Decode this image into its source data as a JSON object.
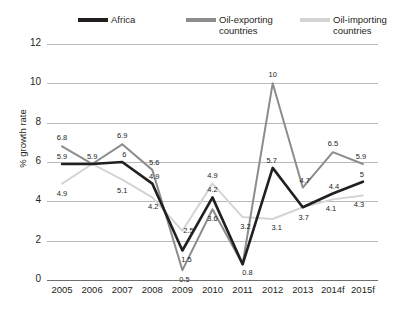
{
  "top_partial_text": "",
  "legend": {
    "entries": [
      {
        "label": "Africa",
        "color": "#231f20"
      },
      {
        "label": "Oil-exporting\ncountries",
        "color": "#8c8c8c"
      },
      {
        "label": "Oil-importing\ncountries",
        "color": "#d4d4d4"
      }
    ]
  },
  "axis": {
    "ylabel": "% growth rate",
    "yticks": [
      "0",
      "2",
      "4",
      "6",
      "8",
      "10",
      "12"
    ],
    "xticks": [
      "2005",
      "2006",
      "2007",
      "2008",
      "2009",
      "2010",
      "2011",
      "2012",
      "2013",
      "2014f",
      "2015f"
    ]
  },
  "chart_data": {
    "type": "line",
    "title": "",
    "xlabel": "",
    "ylabel": "% growth rate",
    "ylim": [
      0,
      12
    ],
    "grid": true,
    "legend_position": "top",
    "categories": [
      "2005",
      "2006",
      "2007",
      "2008",
      "2009",
      "2010",
      "2011",
      "2012",
      "2013",
      "2014f",
      "2015f"
    ],
    "series": [
      {
        "name": "Africa",
        "color": "#231f20",
        "values": [
          5.9,
          5.9,
          6.0,
          4.9,
          1.5,
          4.2,
          0.8,
          5.7,
          3.7,
          4.4,
          5.0
        ],
        "labels": [
          "5.9",
          "5.9",
          "6",
          "4.9",
          "1.5",
          "4.2",
          "0.8",
          "5.7",
          "3.7",
          "4.4",
          "5"
        ]
      },
      {
        "name": "Oil-exporting countries",
        "color": "#8c8c8c",
        "values": [
          6.8,
          5.9,
          6.9,
          5.6,
          0.5,
          3.6,
          0.8,
          10.0,
          4.7,
          6.5,
          5.9
        ],
        "labels": [
          "6.8",
          "5.9",
          "6.9",
          "5.6",
          "0.5",
          "3.6",
          "0.8",
          "10",
          "4.7",
          "6.5",
          "5.9"
        ]
      },
      {
        "name": "Oil-importing countries",
        "color": "#d4d4d4",
        "values": [
          4.9,
          5.9,
          5.1,
          4.2,
          2.5,
          4.9,
          3.2,
          3.1,
          3.7,
          4.1,
          4.3
        ],
        "labels": [
          "4.9",
          "5.9",
          "5.1",
          "4.2",
          "2.5",
          "4.9",
          "3.2",
          "3.1",
          "3.7",
          "4.1",
          "4.3"
        ]
      }
    ],
    "point_labels": [
      {
        "series": "Oil-exporting countries",
        "x": "2005",
        "value": 6.8,
        "text": "6.8",
        "dx": 0,
        "dy": -9
      },
      {
        "series": "Africa",
        "x": "2005",
        "value": 5.9,
        "text": "5.9",
        "dx": 0,
        "dy": -8
      },
      {
        "series": "Oil-importing countries",
        "x": "2005",
        "value": 4.9,
        "text": "4.9",
        "dx": 0,
        "dy": 9
      },
      {
        "series": "Africa",
        "x": "2006",
        "value": 5.9,
        "text": "5.9",
        "dx": 0,
        "dy": -8
      },
      {
        "series": "Oil-exporting countries",
        "x": "2007",
        "value": 6.9,
        "text": "6.9",
        "dx": 0,
        "dy": -9
      },
      {
        "series": "Africa",
        "x": "2007",
        "value": 6.0,
        "text": "6",
        "dx": 2,
        "dy": -8
      },
      {
        "series": "Oil-importing countries",
        "x": "2007",
        "value": 5.1,
        "text": "5.1",
        "dx": 0,
        "dy": 10
      },
      {
        "series": "Oil-exporting countries",
        "x": "2008",
        "value": 5.6,
        "text": "5.6",
        "dx": 2,
        "dy": -8
      },
      {
        "series": "Africa",
        "x": "2008",
        "value": 4.9,
        "text": "4.9",
        "dx": 2,
        "dy": -8
      },
      {
        "series": "Oil-importing countries",
        "x": "2008",
        "value": 4.2,
        "text": "4.2",
        "dx": 1,
        "dy": 9
      },
      {
        "series": "Oil-importing countries",
        "x": "2009",
        "value": 2.5,
        "text": "2.5",
        "dx": 6,
        "dy": -1
      },
      {
        "series": "Africa",
        "x": "2009",
        "value": 1.5,
        "text": "1.5",
        "dx": 4,
        "dy": 8
      },
      {
        "series": "Oil-exporting countries",
        "x": "2009",
        "value": 0.5,
        "text": "0.5",
        "dx": 2,
        "dy": 9
      },
      {
        "series": "Oil-importing countries",
        "x": "2010",
        "value": 4.9,
        "text": "4.9",
        "dx": 0,
        "dy": -9
      },
      {
        "series": "Africa",
        "x": "2010",
        "value": 4.2,
        "text": "4.2",
        "dx": 0,
        "dy": -8
      },
      {
        "series": "Oil-exporting countries",
        "x": "2010",
        "value": 3.6,
        "text": "3.6",
        "dx": 0,
        "dy": 9
      },
      {
        "series": "Oil-importing countries",
        "x": "2011",
        "value": 3.2,
        "text": "3.2",
        "dx": 3,
        "dy": 9
      },
      {
        "series": "Africa",
        "x": "2011",
        "value": 0.8,
        "text": "0.8",
        "dx": 5,
        "dy": 8
      },
      {
        "series": "Oil-exporting countries",
        "x": "2012",
        "value": 10.0,
        "text": "10",
        "dx": 0,
        "dy": -9
      },
      {
        "series": "Africa",
        "x": "2012",
        "value": 5.7,
        "text": "5.7",
        "dx": -1,
        "dy": -8
      },
      {
        "series": "Oil-importing countries",
        "x": "2012",
        "value": 3.1,
        "text": "3.1",
        "dx": 4,
        "dy": 8
      },
      {
        "series": "Oil-exporting countries",
        "x": "2013",
        "value": 4.7,
        "text": "4.7",
        "dx": 2,
        "dy": -8
      },
      {
        "series": "Africa",
        "x": "2013",
        "value": 3.7,
        "text": "3.7",
        "dx": 1,
        "dy": 10
      },
      {
        "series": "Oil-exporting countries",
        "x": "2014f",
        "value": 6.5,
        "text": "6.5",
        "dx": 0,
        "dy": -9
      },
      {
        "series": "Africa",
        "x": "2014f",
        "value": 4.4,
        "text": "4.4",
        "dx": 1,
        "dy": -7
      },
      {
        "series": "Oil-importing countries",
        "x": "2014f",
        "value": 4.1,
        "text": "4.1",
        "dx": -2,
        "dy": 9
      },
      {
        "series": "Oil-exporting countries",
        "x": "2015f",
        "value": 5.9,
        "text": "5.9",
        "dx": -2,
        "dy": -8
      },
      {
        "series": "Africa",
        "x": "2015f",
        "value": 5.0,
        "text": "5",
        "dx": -1,
        "dy": -8
      },
      {
        "series": "Oil-importing countries",
        "x": "2015f",
        "value": 4.3,
        "text": "4.3",
        "dx": -4,
        "dy": 9
      }
    ]
  }
}
